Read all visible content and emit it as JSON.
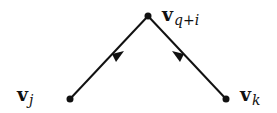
{
  "diagram": {
    "type": "directed-graph",
    "nodes": [
      {
        "id": "top",
        "label_base": "v",
        "label_sub": "q+i",
        "x": 148,
        "y": 16
      },
      {
        "id": "left",
        "label_base": "v",
        "label_sub": "j",
        "x": 70,
        "y": 99
      },
      {
        "id": "right",
        "label_base": "v",
        "label_sub": "k",
        "x": 226,
        "y": 99
      }
    ],
    "edges": [
      {
        "from": "top",
        "to": "left",
        "directed": true
      },
      {
        "from": "top",
        "to": "right",
        "directed": true
      }
    ],
    "colors": {
      "stroke": "#111111",
      "background": "#ffffff"
    }
  }
}
